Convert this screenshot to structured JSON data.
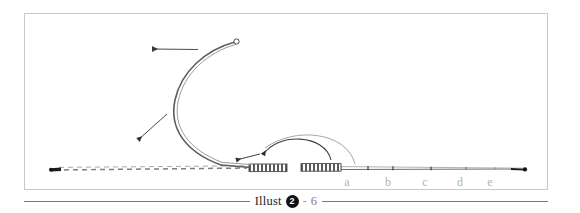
{
  "figure": {
    "frame": {
      "border_color": "#c9c9c9",
      "background": "#ffffff"
    },
    "title_hidden": "",
    "segment_labels": [
      {
        "id": "a",
        "label": "a",
        "x": 346,
        "y": 172
      },
      {
        "id": "b",
        "label": "b",
        "x": 387,
        "y": 172
      },
      {
        "id": "c",
        "label": "c",
        "x": 424,
        "y": 172
      },
      {
        "id": "d",
        "label": "d",
        "x": 459,
        "y": 172
      },
      {
        "id": "e",
        "label": "e",
        "x": 489,
        "y": 172
      }
    ],
    "elements": {
      "curve_tip_marker": "open-circle",
      "left_end_marker": "small-dot",
      "right_end_marker": "filled-dot",
      "dashed_rod": "dashed-line",
      "coil_left": "hatched-coil",
      "coil_right": "hatched-coil",
      "arrow_top": "left-arrow",
      "arrow_diagonal": "down-left-arrow",
      "arrow_arc": "curved-arrow",
      "arrow_to_curve": "up-left-arrow",
      "arrow_to_coil": "up-left-arrow"
    },
    "colors": {
      "line": "#4a4a4a",
      "light_line": "#9a9a9a",
      "label": "#b3b3b3",
      "frame": "#c9c9c9",
      "caption_rule": "#7a7a7a"
    }
  },
  "caption": {
    "word": "Illust",
    "badge": "2",
    "dash": "-",
    "number": "6"
  }
}
